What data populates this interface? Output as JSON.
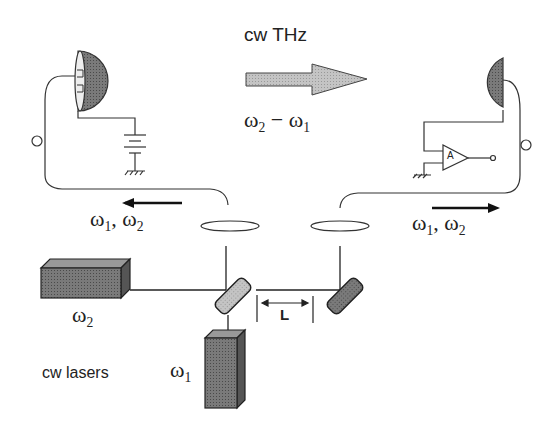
{
  "diagram": {
    "title": "cw THz",
    "beam_label": {
      "main": "ω",
      "sub1": "2",
      "minus": " − ",
      "main2": "ω",
      "sub2": "1"
    },
    "left_beam_label": {
      "a": "ω",
      "a_sub": "1",
      "sep": ", ",
      "b": "ω",
      "b_sub": "2"
    },
    "right_beam_label": {
      "a": "ω",
      "a_sub": "1",
      "sep": ", ",
      "b": "ω",
      "b_sub": "2"
    },
    "laser_top": {
      "a": "ω",
      "a_sub": "2"
    },
    "laser_bottom": {
      "a": "ω",
      "a_sub": "1"
    },
    "lasers_label": "cw lasers",
    "delay_label": "L",
    "amp_label": "A",
    "components": [
      "emitter-antenna",
      "bias-battery",
      "detector-antenna",
      "amplifier",
      "fiber-lens-left",
      "fiber-lens-right",
      "mirror-left",
      "mirror-right",
      "laser-omega2",
      "laser-omega1",
      "thz-arrow"
    ],
    "colors": {
      "line": "#333333",
      "fill_dark": "#6e6e6e",
      "fill_light": "#bdbdbd"
    }
  }
}
